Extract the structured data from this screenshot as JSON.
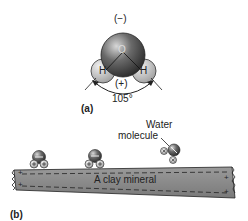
{
  "panel_a": {
    "label": "(a)",
    "oxygen_atom": "O",
    "hydrogen_left": "H",
    "hydrogen_right": "H",
    "negative_charge": "(−)",
    "positive_charge": "(+)",
    "bond_angle": "105°"
  },
  "panel_b": {
    "label": "(b)",
    "water_label_line1": "Water",
    "water_label_line2": "molecule",
    "clay_label": "A clay mineral",
    "clay_edge_charge": "+"
  },
  "colors": {
    "oxygen": "#4a4a4a",
    "hydrogen": "#b8b8b8",
    "clay": "#8c8c8c",
    "outline": "#222222"
  }
}
